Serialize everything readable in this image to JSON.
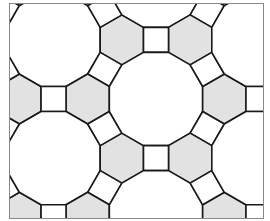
{
  "diagram": {
    "type": "truncated-trihexagonal-tiling",
    "tiles": [
      {
        "shape": "dodecagon",
        "fill": "#ffffff"
      },
      {
        "shape": "hexagon",
        "fill": "#e2e2e2"
      },
      {
        "shape": "square",
        "fill": "#ffffff"
      }
    ],
    "stroke": "#1a1a1a",
    "frame_color": "#888888",
    "edge_length_px": 25,
    "center": [
      156,
      99
    ],
    "frame": {
      "x": 9,
      "y": 3,
      "width": 254,
      "height": 215
    }
  }
}
